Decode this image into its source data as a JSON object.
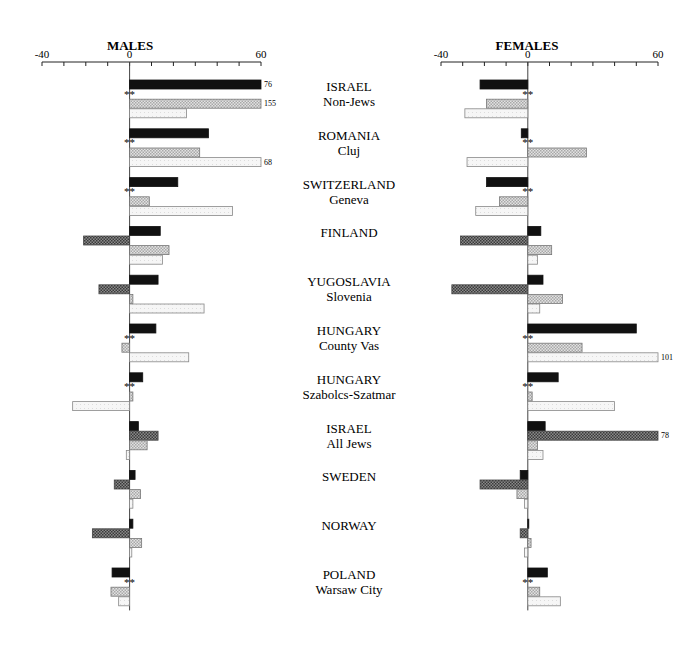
{
  "chart_data": {
    "type": "bar",
    "orientation": "horizontal",
    "grid": false,
    "series_styles": [
      {
        "key": "s1",
        "fill": "#111111",
        "pattern": "solid"
      },
      {
        "key": "s2",
        "fill": "#6e6e6e",
        "pattern": "dark-crosshatch"
      },
      {
        "key": "s3",
        "fill": "#cfcfcf",
        "pattern": "light-dotted"
      },
      {
        "key": "s4",
        "fill": "#f4f4f4",
        "pattern": "very-light"
      }
    ],
    "groups": [
      {
        "label": "ISRAEL",
        "sublabel": "Non-Jews"
      },
      {
        "label": "ROMANIA",
        "sublabel": "Cluj"
      },
      {
        "label": "SWITZERLAND",
        "sublabel": "Geneva"
      },
      {
        "label": "FINLAND",
        "sublabel": ""
      },
      {
        "label": "YUGOSLAVIA",
        "sublabel": "Slovenia"
      },
      {
        "label": "HUNGARY",
        "sublabel": "County Vas"
      },
      {
        "label": "HUNGARY",
        "sublabel": "Szabolcs-Szatmar"
      },
      {
        "label": "ISRAEL",
        "sublabel": "All Jews"
      },
      {
        "label": "SWEDEN",
        "sublabel": ""
      },
      {
        "label": "NORWAY",
        "sublabel": ""
      },
      {
        "label": "POLAND",
        "sublabel": "Warsaw City"
      }
    ],
    "panels": [
      {
        "title": "MALES",
        "xlim": [
          -40,
          60
        ],
        "ticks": [
          -40,
          -30,
          -20,
          -10,
          0,
          10,
          20,
          30,
          40,
          50,
          60
        ],
        "tick_labels": [
          "-40",
          "0",
          "60"
        ],
        "tick_label_values": [
          -40,
          0,
          60
        ],
        "series": [
          {
            "name": "s1",
            "values": [
              60,
              36,
              22,
              14,
              13,
              12,
              6,
              4,
              2.5,
              1.5,
              -8
            ]
          },
          {
            "name": "s2",
            "values": [
              null,
              null,
              null,
              -21,
              -14,
              null,
              null,
              13,
              -7,
              -17,
              null
            ]
          },
          {
            "name": "s3",
            "values": [
              60,
              32,
              9,
              18,
              1.5,
              -3.5,
              1.5,
              8,
              5,
              5.5,
              -8.5
            ]
          },
          {
            "name": "s4",
            "values": [
              26,
              60,
              47,
              15,
              34,
              27,
              -26,
              -1.5,
              1.5,
              1,
              -5
            ]
          }
        ],
        "missing_markers": [
          {
            "group": 0,
            "text": "**"
          },
          {
            "group": 1,
            "text": "**"
          },
          {
            "group": 2,
            "text": "**"
          },
          {
            "group": 5,
            "text": "**"
          },
          {
            "group": 6,
            "text": "**"
          },
          {
            "group": 10,
            "text": "**"
          }
        ],
        "annotations": [
          {
            "group": 0,
            "series": "s1",
            "text": "76"
          },
          {
            "group": 0,
            "series": "s3",
            "text": "155"
          },
          {
            "group": 1,
            "series": "s4",
            "text": "68"
          }
        ]
      },
      {
        "title": "FEMALES",
        "xlim": [
          -40,
          60
        ],
        "ticks": [
          -40,
          -30,
          -20,
          -10,
          0,
          10,
          20,
          30,
          40,
          50,
          60
        ],
        "tick_labels": [
          "-40",
          "0",
          "60"
        ],
        "tick_label_values": [
          -40,
          0,
          60
        ],
        "series": [
          {
            "name": "s1",
            "values": [
              -22,
              -3,
              -19,
              6,
              7,
              50,
              14,
              8,
              -3.5,
              0,
              9
            ]
          },
          {
            "name": "s2",
            "values": [
              null,
              null,
              null,
              -31,
              -35,
              null,
              null,
              60,
              -22,
              -3.5,
              null
            ]
          },
          {
            "name": "s3",
            "values": [
              -19,
              27,
              -13,
              11,
              16,
              25,
              2,
              4.5,
              -5,
              1.5,
              5.5
            ]
          },
          {
            "name": "s4",
            "values": [
              -29,
              -28,
              -24,
              4.5,
              5.5,
              60,
              40,
              7,
              -1.5,
              -1.5,
              15
            ]
          }
        ],
        "missing_markers": [
          {
            "group": 0,
            "text": "**"
          },
          {
            "group": 1,
            "text": "**"
          },
          {
            "group": 2,
            "text": "**"
          },
          {
            "group": 5,
            "text": "**"
          },
          {
            "group": 6,
            "text": "**"
          },
          {
            "group": 10,
            "text": "**"
          }
        ],
        "annotations": [
          {
            "group": 5,
            "series": "s4",
            "text": "101"
          },
          {
            "group": 7,
            "series": "s2",
            "text": "78"
          }
        ]
      }
    ]
  }
}
